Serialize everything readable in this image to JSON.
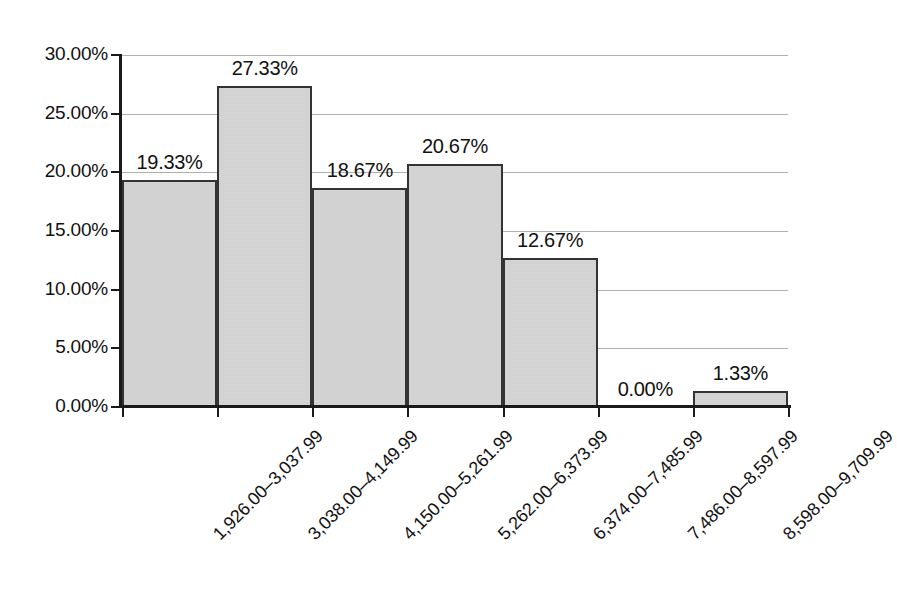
{
  "chart_data": {
    "type": "bar",
    "title": "",
    "subtitle": "",
    "xlabel": "",
    "ylabel": "",
    "categories": [
      "1,926.00–3,037.99",
      "3,038.00–4,149.99",
      "4,150.00–5,261.99",
      "5,262.00–6,373.99",
      "6,374.00–7,485.99",
      "7,486.00–8,597.99",
      "8,598.00–9,709.99"
    ],
    "values": [
      19.33,
      27.33,
      18.67,
      20.67,
      12.67,
      0.0,
      1.33
    ],
    "value_labels": [
      "19.33%",
      "27.33%",
      "18.67%",
      "20.67%",
      "12.67%",
      "0.00%",
      "1.33%"
    ],
    "ylim": [
      0,
      30
    ],
    "ytick_values": [
      0,
      5,
      10,
      15,
      20,
      25,
      30
    ],
    "ytick_labels": [
      "0.00%",
      "5.00%",
      "10.00%",
      "15.00%",
      "20.00%",
      "25.00%",
      "30.00%"
    ],
    "grid": true,
    "legend": null,
    "legend_position": "none",
    "colors": {
      "bar_fill": "#cbcbcb",
      "bar_border": "#333333",
      "gridline": "#b0b0b0",
      "axis": "#1a1a1a",
      "text": "#111111",
      "background": "#ffffff"
    }
  }
}
